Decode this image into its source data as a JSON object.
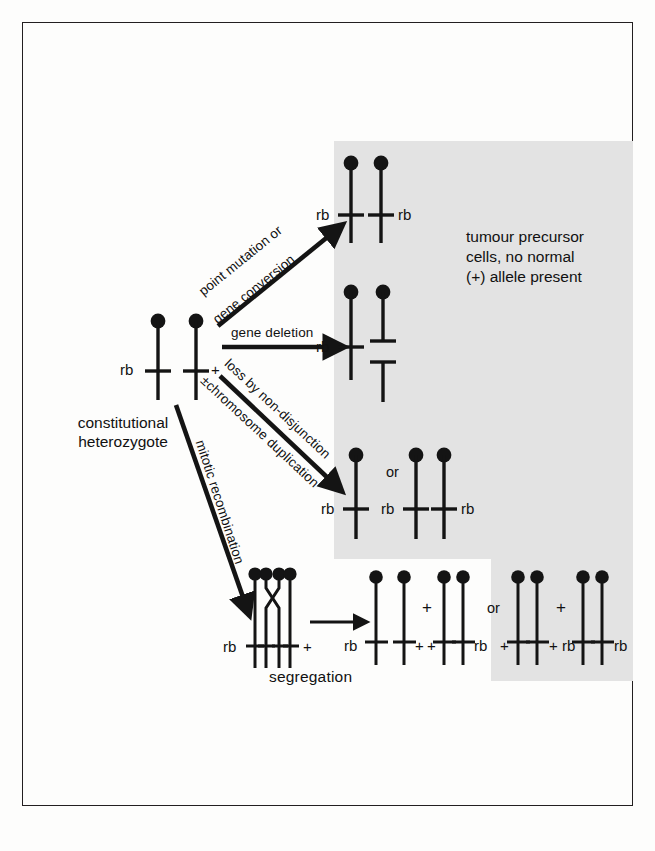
{
  "figure": {
    "title_hidden": "",
    "background_color": "#fdfdfc",
    "border_color": "#231f20",
    "shade_color": "#e3e3e3",
    "ink_color": "#111111"
  },
  "source_cell": {
    "left_allele": "rb",
    "right_allele": "+",
    "caption_line1": "constitutional",
    "caption_line2": "heterozygote"
  },
  "pathways": [
    {
      "id": "point-mutation",
      "label_line1": "point mutation or",
      "label_line2": "gene conversion"
    },
    {
      "id": "gene-deletion",
      "label_line1": "gene deletion",
      "label_line2": ""
    },
    {
      "id": "non-disjunction",
      "label_line1": "loss by non-disjunction",
      "label_line2": "±chromosome duplication"
    },
    {
      "id": "mitotic-recombination",
      "label_line1": "mitotic recombination",
      "label_line2": ""
    }
  ],
  "outcomes": {
    "point_mutation": {
      "left_allele": "rb",
      "right_allele": "rb"
    },
    "gene_deletion": {
      "left_allele": "rb",
      "right_allele": ""
    },
    "non_disjunction": {
      "single_allele": "rb",
      "or_word": "or",
      "pair_left_allele": "rb",
      "pair_right_allele": "rb"
    },
    "mitotic_recombination": {
      "parent_left_allele": "rb",
      "parent_right_allele": "+",
      "segregation_label": "segregation",
      "product_1_left": "rb",
      "product_1_right": "+",
      "plus_1": "+",
      "product_2_left": "+",
      "product_2_right": "rb",
      "or_word": "or",
      "product_3_left": "+",
      "product_3_right": "+",
      "plus_2": "+",
      "product_4_left": "rb",
      "product_4_right": "rb"
    }
  },
  "tumour_panel": {
    "line1": "tumour precursor",
    "line2": "cells, no normal",
    "line3": "(+) allele present"
  }
}
